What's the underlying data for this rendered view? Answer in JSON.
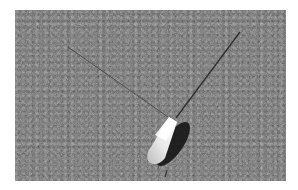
{
  "image": {
    "description": "Grayscale photograph of a small white pointed object (pen/float tip) lying on asphalt with two thin lines extending up-left and up-right",
    "colors": {
      "border": "#ffffff",
      "asphalt": "#6f6f6f",
      "object_highlight": "#f4f4f4",
      "shadow": "#1a1a1a",
      "line": "#3a3a3a"
    }
  }
}
